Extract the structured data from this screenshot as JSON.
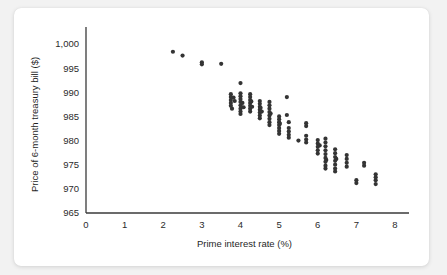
{
  "figure": {
    "background_color": "#f2f2f2",
    "card_color": "#ffffff",
    "accent_color": "#343434"
  },
  "chart_data": {
    "type": "scatter",
    "title": "",
    "xlabel": "Prime interest rate (%)",
    "ylabel": "Price of 6-month treasury bill ($)",
    "xlim": [
      0,
      8
    ],
    "ylim": [
      965,
      1000
    ],
    "xticks": [
      0,
      1,
      2,
      3,
      4,
      5,
      6,
      7,
      8
    ],
    "yticks": [
      965,
      970,
      975,
      980,
      985,
      990,
      995,
      1000
    ],
    "xticklabels": [
      "0",
      "1",
      "2",
      "3",
      "4",
      "5",
      "6",
      "7",
      "8"
    ],
    "yticklabels": [
      "965",
      "970",
      "975",
      "980",
      "985",
      "990",
      "995",
      "1,000"
    ],
    "grid": false,
    "legend": null,
    "marker": "circle",
    "marker_color": "#343434",
    "marker_size": 4.2,
    "points": [
      [
        2.25,
        998.4
      ],
      [
        2.5,
        997.6
      ],
      [
        3.0,
        996.2
      ],
      [
        3.0,
        995.8
      ],
      [
        3.5,
        995.9
      ],
      [
        3.75,
        989.6
      ],
      [
        3.75,
        989.0
      ],
      [
        3.75,
        988.4
      ],
      [
        3.75,
        987.8
      ],
      [
        3.75,
        987.2
      ],
      [
        3.78,
        986.6
      ],
      [
        3.82,
        988.9
      ],
      [
        3.85,
        988.2
      ],
      [
        4.0,
        991.9
      ],
      [
        4.0,
        989.8
      ],
      [
        4.0,
        989.2
      ],
      [
        4.0,
        988.6
      ],
      [
        4.0,
        988.0
      ],
      [
        4.0,
        987.3
      ],
      [
        4.0,
        986.6
      ],
      [
        4.0,
        986.0
      ],
      [
        4.0,
        985.5
      ],
      [
        4.05,
        987.8
      ],
      [
        4.08,
        986.9
      ],
      [
        4.25,
        989.6
      ],
      [
        4.25,
        989.0
      ],
      [
        4.25,
        988.4
      ],
      [
        4.25,
        987.8
      ],
      [
        4.25,
        987.2
      ],
      [
        4.25,
        986.6
      ],
      [
        4.25,
        986.0
      ],
      [
        4.28,
        988.1
      ],
      [
        4.3,
        987.0
      ],
      [
        4.5,
        988.2
      ],
      [
        4.5,
        987.6
      ],
      [
        4.5,
        987.0
      ],
      [
        4.5,
        986.4
      ],
      [
        4.5,
        985.8
      ],
      [
        4.5,
        985.2
      ],
      [
        4.5,
        984.6
      ],
      [
        4.52,
        986.8
      ],
      [
        4.55,
        986.0
      ],
      [
        4.75,
        988.0
      ],
      [
        4.75,
        987.3
      ],
      [
        4.75,
        986.6
      ],
      [
        4.75,
        985.9
      ],
      [
        4.75,
        985.2
      ],
      [
        4.75,
        984.5
      ],
      [
        4.75,
        983.8
      ],
      [
        4.75,
        983.2
      ],
      [
        4.78,
        985.6
      ],
      [
        5.0,
        985.0
      ],
      [
        5.0,
        984.4
      ],
      [
        5.0,
        983.8
      ],
      [
        5.0,
        983.2
      ],
      [
        5.0,
        982.6
      ],
      [
        5.0,
        982.0
      ],
      [
        5.0,
        981.4
      ],
      [
        5.02,
        983.5
      ],
      [
        5.2,
        989.0
      ],
      [
        5.2,
        985.3
      ],
      [
        5.25,
        983.8
      ],
      [
        5.25,
        982.6
      ],
      [
        5.25,
        981.9
      ],
      [
        5.25,
        981.2
      ],
      [
        5.25,
        980.6
      ],
      [
        5.5,
        980.0
      ],
      [
        5.7,
        983.6
      ],
      [
        5.7,
        983.0
      ],
      [
        5.7,
        981.0
      ],
      [
        5.7,
        980.2
      ],
      [
        5.7,
        979.6
      ],
      [
        6.0,
        980.1
      ],
      [
        6.0,
        979.4
      ],
      [
        6.0,
        978.7
      ],
      [
        6.0,
        978.0
      ],
      [
        6.0,
        977.3
      ],
      [
        6.05,
        979.0
      ],
      [
        6.2,
        980.4
      ],
      [
        6.2,
        979.6
      ],
      [
        6.2,
        978.8
      ],
      [
        6.2,
        978.0
      ],
      [
        6.2,
        977.2
      ],
      [
        6.2,
        976.4
      ],
      [
        6.2,
        975.6
      ],
      [
        6.2,
        974.8
      ],
      [
        6.2,
        974.2
      ],
      [
        6.22,
        976.0
      ],
      [
        6.45,
        978.2
      ],
      [
        6.45,
        977.4
      ],
      [
        6.45,
        976.6
      ],
      [
        6.45,
        975.8
      ],
      [
        6.45,
        975.0
      ],
      [
        6.45,
        974.2
      ],
      [
        6.45,
        973.6
      ],
      [
        6.48,
        976.2
      ],
      [
        6.75,
        977.0
      ],
      [
        6.75,
        976.2
      ],
      [
        6.75,
        975.4
      ],
      [
        6.75,
        974.6
      ],
      [
        7.0,
        971.8
      ],
      [
        7.0,
        971.2
      ],
      [
        7.2,
        975.4
      ],
      [
        7.2,
        974.8
      ],
      [
        7.5,
        973.0
      ],
      [
        7.5,
        972.4
      ],
      [
        7.5,
        971.8
      ],
      [
        7.5,
        971.0
      ]
    ]
  }
}
